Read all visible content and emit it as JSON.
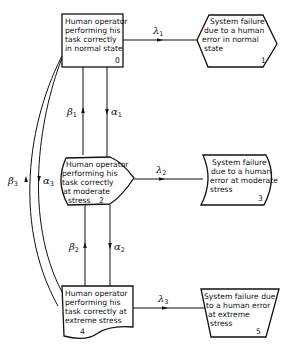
{
  "diagram": {
    "type": "state-transition",
    "nodes": [
      {
        "id": "0",
        "lines": [
          "Human operator",
          "performing his",
          "task correctly",
          "in normal state"
        ],
        "number": "0",
        "shape": "rectangle"
      },
      {
        "id": "1",
        "lines": [
          "System failure",
          "due to a human",
          "error in normal",
          "state"
        ],
        "number": "1",
        "shape": "hexagon"
      },
      {
        "id": "2",
        "lines": [
          "Human operator",
          "performing his",
          "task correctly",
          "at moderate",
          "stress"
        ],
        "number": "2",
        "shape": "pointed-right"
      },
      {
        "id": "3",
        "lines": [
          "System failure",
          "due to a human",
          "error at moderate",
          "stress"
        ],
        "number": "3",
        "shape": "curved-parallelogram"
      },
      {
        "id": "4",
        "lines": [
          "Human operator",
          "performing his",
          "task correctly at",
          "extreme stress"
        ],
        "number": "4",
        "shape": "document"
      },
      {
        "id": "5",
        "lines": [
          "System failure due",
          "to a human error",
          "at extreme",
          "stress"
        ],
        "number": "5",
        "shape": "trapezoid"
      }
    ],
    "edges": [
      {
        "from": "0",
        "to": "1",
        "symbol": "λ",
        "sub": "1"
      },
      {
        "from": "2",
        "to": "3",
        "symbol": "λ",
        "sub": "2"
      },
      {
        "from": "4",
        "to": "5",
        "symbol": "λ",
        "sub": "3"
      },
      {
        "from": "0",
        "to": "2",
        "symbol": "α",
        "sub": "1"
      },
      {
        "from": "2",
        "to": "0",
        "symbol": "β",
        "sub": "1"
      },
      {
        "from": "2",
        "to": "4",
        "symbol": "α",
        "sub": "2"
      },
      {
        "from": "4",
        "to": "2",
        "symbol": "β",
        "sub": "2"
      },
      {
        "from": "0",
        "to": "4",
        "symbol": "α",
        "sub": "3"
      },
      {
        "from": "4",
        "to": "0",
        "symbol": "β",
        "sub": "3"
      }
    ]
  }
}
